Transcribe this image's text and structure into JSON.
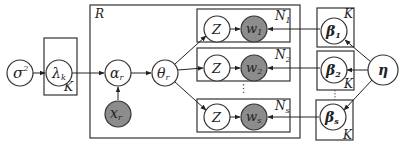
{
  "diagram": {
    "type": "plate-notation graphical model",
    "nodes": {
      "sigma2": {
        "label": "σ",
        "sup": "2",
        "observed": false
      },
      "lambda": {
        "label": "λ",
        "sub": "k",
        "observed": false
      },
      "alpha": {
        "label": "α",
        "sub": "r",
        "observed": false
      },
      "x": {
        "label": "x",
        "sub": "r",
        "observed": true
      },
      "theta": {
        "label": "θ",
        "sub": "r",
        "observed": false
      },
      "z1": {
        "label": "Z",
        "observed": false
      },
      "w1": {
        "label": "w",
        "sub": "1",
        "observed": true
      },
      "z2": {
        "label": "Z",
        "observed": false
      },
      "w2": {
        "label": "w",
        "sub": "2",
        "observed": true
      },
      "zs": {
        "label": "Z",
        "observed": false
      },
      "ws": {
        "label": "w",
        "sub": "s",
        "observed": true
      },
      "beta1": {
        "label": "β",
        "sub": "1",
        "observed": false
      },
      "beta2": {
        "label": "β",
        "sub": "2",
        "observed": false
      },
      "betas": {
        "label": "β",
        "sub": "s",
        "observed": false
      },
      "eta": {
        "label": "η",
        "observed": false
      }
    },
    "plates": {
      "lambda_plate": {
        "label": "K"
      },
      "r_plate": {
        "label": "R"
      },
      "n1_plate": {
        "label": "N",
        "sub": "1"
      },
      "n2_plate": {
        "label": "N",
        "sub": "2"
      },
      "ns_plate": {
        "label": "N",
        "sub": "s"
      },
      "beta1_plate": {
        "label": "K"
      },
      "beta2_plate": {
        "label": "K"
      },
      "betas_plate": {
        "label": "K"
      }
    },
    "ellipsis": "⋮",
    "edges": [
      [
        "sigma2",
        "lambda"
      ],
      [
        "lambda",
        "alpha"
      ],
      [
        "x",
        "alpha"
      ],
      [
        "alpha",
        "theta"
      ],
      [
        "theta",
        "z1"
      ],
      [
        "theta",
        "z2"
      ],
      [
        "theta",
        "zs"
      ],
      [
        "z1",
        "w1"
      ],
      [
        "z2",
        "w2"
      ],
      [
        "zs",
        "ws"
      ],
      [
        "beta1",
        "w1"
      ],
      [
        "beta2",
        "w2"
      ],
      [
        "betas",
        "ws"
      ],
      [
        "eta",
        "beta1"
      ],
      [
        "eta",
        "beta2"
      ],
      [
        "eta",
        "betas"
      ]
    ],
    "colors": {
      "observed_fill": "#8c8c8c",
      "stroke": "#333333",
      "background": "#ffffff"
    }
  }
}
